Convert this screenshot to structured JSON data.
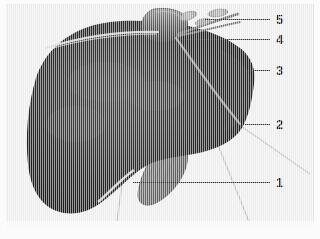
{
  "figure": {
    "kind": "anatomical-illustration",
    "view": "anterior-superior",
    "background_color": "#f0f0f0",
    "organ_color": "#262626",
    "accessory_color": "#7d7d7d",
    "label_color": "#1a1a1a",
    "leader_color": "#333333"
  },
  "labels": [
    {
      "id": "label-1",
      "text": "1",
      "x": 276,
      "y": 176,
      "leader": {
        "x1": 133,
        "y1": 182,
        "x2": 270,
        "y2": 182
      }
    },
    {
      "id": "label-2",
      "text": "2",
      "x": 276,
      "y": 118,
      "leader": {
        "x1": 245,
        "y1": 124,
        "x2": 270,
        "y2": 124
      }
    },
    {
      "id": "label-3",
      "text": "3",
      "x": 276,
      "y": 64,
      "leader": {
        "x1": 244,
        "y1": 70,
        "x2": 270,
        "y2": 70
      }
    },
    {
      "id": "label-4",
      "text": "4",
      "x": 276,
      "y": 33,
      "leader": {
        "x1": 178,
        "y1": 39,
        "x2": 270,
        "y2": 39
      }
    },
    {
      "id": "label-5",
      "text": "5",
      "x": 276,
      "y": 13,
      "leader": {
        "x1": 205,
        "y1": 19,
        "x2": 270,
        "y2": 19
      }
    }
  ],
  "structures": {
    "liver_lobe_main": "liver-right-lobe",
    "liver_lobe_left": "liver-left-lobe",
    "gallbladder": "gallbladder",
    "caudate_region": "superior-process",
    "vessels": "hepatic-vessels",
    "ligament": "falciform-ligament-highlight",
    "fissure_line": "interlobar-fissure"
  }
}
